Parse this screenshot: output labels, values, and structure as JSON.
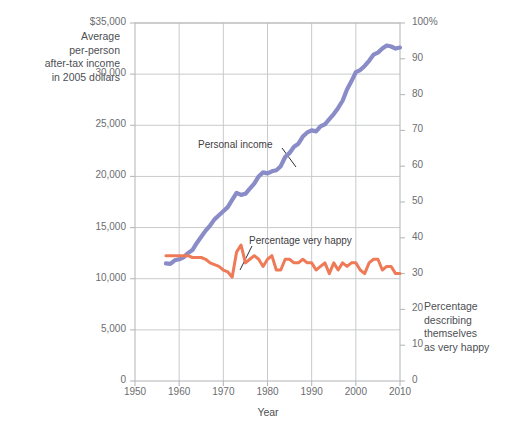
{
  "chart_data": {
    "type": "line",
    "title": "",
    "subtitle": "",
    "xlabel": "Year",
    "ylabel": "Average per-person after-tax income in 2005 dollars",
    "y2label": "Percentage describing themselves as very happy",
    "xlim": [
      1950,
      2010
    ],
    "ylim": [
      0,
      35000
    ],
    "y2lim": [
      0,
      100
    ],
    "grid": true,
    "legend_position": "inline-annotation",
    "xticks": [
      1950,
      1960,
      1970,
      1980,
      1990,
      2000,
      2010
    ],
    "xticklabels": [
      "1950",
      "1960",
      "1970",
      "1980",
      "1990",
      "2000",
      "2010"
    ],
    "yticks": [
      0,
      5000,
      10000,
      15000,
      20000,
      25000,
      30000,
      35000
    ],
    "yticklabels": [
      "0",
      "5,000",
      "10,000",
      "15,000",
      "20,000",
      "25,000",
      "30,000",
      "$35,000"
    ],
    "y2ticks": [
      0,
      10,
      20,
      30,
      40,
      50,
      60,
      70,
      80,
      90,
      100
    ],
    "y2ticklabels": [
      "0",
      "10",
      "20",
      "30",
      "40",
      "50",
      "60",
      "70",
      "80",
      "90",
      "100%"
    ],
    "series": [
      {
        "name": "Personal income",
        "axis": "left",
        "color": "#8a8cc8",
        "label_text": "Personal income",
        "x": [
          1957,
          1958,
          1959,
          1960,
          1961,
          1962,
          1963,
          1964,
          1965,
          1966,
          1967,
          1968,
          1969,
          1970,
          1971,
          1972,
          1973,
          1974,
          1975,
          1976,
          1977,
          1978,
          1979,
          1980,
          1981,
          1982,
          1983,
          1984,
          1985,
          1986,
          1987,
          1988,
          1989,
          1990,
          1991,
          1992,
          1993,
          1994,
          1995,
          1996,
          1997,
          1998,
          1999,
          2000,
          2001,
          2002,
          2003,
          2004,
          2005,
          2006,
          2007,
          2008,
          2009,
          2010
        ],
        "values": [
          11500,
          11450,
          11800,
          11900,
          12100,
          12500,
          12800,
          13500,
          14100,
          14700,
          15200,
          15800,
          16200,
          16600,
          17000,
          17700,
          18400,
          18200,
          18300,
          18800,
          19300,
          20000,
          20400,
          20300,
          20500,
          20600,
          21000,
          21900,
          22300,
          22900,
          23200,
          23900,
          24300,
          24500,
          24400,
          24900,
          25100,
          25600,
          26100,
          26700,
          27400,
          28500,
          29300,
          30200,
          30400,
          30800,
          31300,
          31900,
          32100,
          32500,
          32800,
          32700,
          32500,
          32600
        ]
      },
      {
        "name": "Percentage very happy",
        "axis": "right",
        "color": "#ef7a57",
        "label_text": "Percentage very happy",
        "x": [
          1957,
          1958,
          1959,
          1960,
          1961,
          1962,
          1963,
          1964,
          1965,
          1966,
          1967,
          1968,
          1969,
          1970,
          1971,
          1972,
          1973,
          1974,
          1975,
          1976,
          1977,
          1978,
          1979,
          1980,
          1981,
          1982,
          1983,
          1984,
          1985,
          1986,
          1987,
          1988,
          1989,
          1990,
          1991,
          1992,
          1993,
          1994,
          1995,
          1996,
          1997,
          1998,
          1999,
          2000,
          2001,
          2002,
          2003,
          2004,
          2005,
          2006,
          2007,
          2008,
          2009,
          2010
        ],
        "values": [
          35,
          35,
          35,
          35,
          35,
          35,
          34.5,
          34.5,
          34.5,
          34,
          33,
          32.5,
          32,
          31,
          30.5,
          29,
          36,
          38,
          33,
          34,
          35,
          34,
          32,
          34,
          35,
          31,
          31,
          34,
          34,
          33,
          33,
          34,
          33,
          33,
          31,
          32,
          33,
          30,
          33,
          31,
          33,
          32,
          33,
          33,
          31,
          30,
          33,
          34,
          34,
          31,
          32,
          32,
          30,
          30
        ]
      }
    ],
    "annotations": [
      {
        "text": "Personal income",
        "series": "Personal income"
      },
      {
        "text": "Percentage very happy",
        "series": "Percentage very happy"
      }
    ]
  },
  "axes": {
    "left": {
      "title_lines": [
        "Average",
        "per-person",
        "after-tax income",
        "in 2005 dollars"
      ],
      "title_text": "Average per-person after-tax income in 2005 dollars"
    },
    "right": {
      "title_lines": [
        "Percentage",
        "describing",
        "themselves",
        "as very happy"
      ],
      "title_text": "Percentage describing themselves as very happy"
    },
    "bottom": {
      "title_text": "Year"
    }
  },
  "colors": {
    "income_line": "#8a8cc8",
    "happiness_line": "#ef7a57",
    "grid": "#c9cacc",
    "frame": "#b9babc",
    "text": "#4d4f53",
    "background": "#ffffff"
  }
}
